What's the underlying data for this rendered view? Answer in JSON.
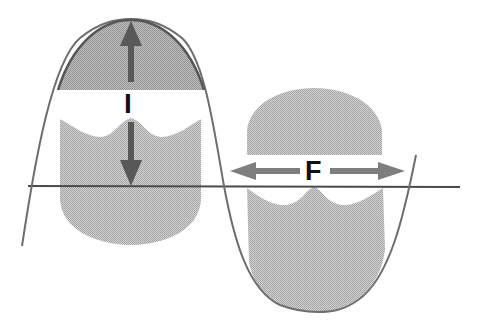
{
  "diagram": {
    "type": "waveform-with-shaded-lobes",
    "labels": {
      "vertical_arrow": "I",
      "horizontal_arrow": "F"
    },
    "colors": {
      "background": "#ffffff",
      "fill_light": "#c8c8c8",
      "fill_dark": "#a9a9a9",
      "curve": "#6e6e6e",
      "baseline": "#4a4a4a",
      "arrow": "#5a5a5a",
      "label": "#111111"
    }
  }
}
